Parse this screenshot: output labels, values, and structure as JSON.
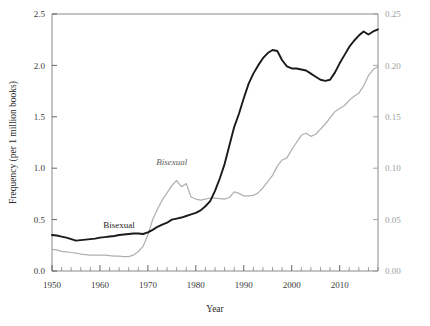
{
  "chart_data": {
    "type": "line",
    "title": "",
    "xlabel": "Year",
    "ylabel": "Frequency (per 1 million books)",
    "ylabel_right": "",
    "xlim": [
      1950,
      2018
    ],
    "ylim": [
      0.0,
      2.5
    ],
    "ylim_right": [
      0.0,
      0.25
    ],
    "grid": false,
    "legend_position": "inline-annotations",
    "xticks": [
      1950,
      1960,
      1970,
      1980,
      1990,
      2000,
      2010
    ],
    "xticklabels": [
      "1950",
      "1960",
      "1970",
      "1980",
      "1990",
      "2000",
      "2010"
    ],
    "xminor_tick_interval": 2,
    "yticks": [
      0.0,
      0.5,
      1.0,
      1.5,
      2.0,
      2.5
    ],
    "yticklabels": [
      "0.0",
      "0.5",
      "1.0",
      "1.5",
      "2.0",
      "2.5"
    ],
    "yticks_right": [
      0.0,
      0.05,
      0.1,
      0.15,
      0.2,
      0.25
    ],
    "yticklabels_right": [
      "0.00",
      "0.05",
      "0.10",
      "0.15",
      "0.20",
      "0.25"
    ],
    "colors": {
      "primary": "#1a1a1a",
      "secondary": "#b0b0b0",
      "axis": "#8a8a8a",
      "right_axis_text": "#9e9e9e"
    },
    "annotations": [
      {
        "text": "Bisexual",
        "series": "primary",
        "x": 1964,
        "y": 0.42,
        "style": "roman"
      },
      {
        "text": "Bisexual",
        "series": "secondary",
        "x": 1975,
        "y": 0.103,
        "style": "italic"
      }
    ],
    "series": [
      {
        "name": "Bisexual",
        "label_style": "roman",
        "axis": "left",
        "color": "#1a1a1a",
        "x": [
          1950,
          1951,
          1952,
          1953,
          1954,
          1955,
          1956,
          1957,
          1958,
          1959,
          1960,
          1961,
          1962,
          1963,
          1964,
          1965,
          1966,
          1967,
          1968,
          1969,
          1970,
          1971,
          1972,
          1973,
          1974,
          1975,
          1976,
          1977,
          1978,
          1979,
          1980,
          1981,
          1982,
          1983,
          1984,
          1985,
          1986,
          1987,
          1988,
          1989,
          1990,
          1991,
          1992,
          1993,
          1994,
          1995,
          1996,
          1997,
          1998,
          1999,
          2000,
          2001,
          2002,
          2003,
          2004,
          2005,
          2006,
          2007,
          2008,
          2009,
          2010,
          2011,
          2012,
          2013,
          2014,
          2015,
          2016,
          2017,
          2018
        ],
        "values": [
          0.35,
          0.345,
          0.335,
          0.325,
          0.31,
          0.295,
          0.3,
          0.305,
          0.31,
          0.315,
          0.325,
          0.33,
          0.335,
          0.34,
          0.35,
          0.355,
          0.36,
          0.365,
          0.365,
          0.36,
          0.375,
          0.4,
          0.43,
          0.45,
          0.47,
          0.5,
          0.51,
          0.52,
          0.535,
          0.55,
          0.565,
          0.59,
          0.63,
          0.68,
          0.78,
          0.9,
          1.04,
          1.22,
          1.4,
          1.53,
          1.68,
          1.82,
          1.92,
          2.0,
          2.07,
          2.12,
          2.15,
          2.14,
          2.05,
          1.99,
          1.97,
          1.97,
          1.96,
          1.95,
          1.92,
          1.89,
          1.86,
          1.85,
          1.86,
          1.93,
          2.02,
          2.1,
          2.18,
          2.24,
          2.29,
          2.33,
          2.3,
          2.33,
          2.35
        ]
      },
      {
        "name": "Bisexual",
        "label_style": "italic",
        "axis": "right",
        "color": "#b0b0b0",
        "x": [
          1950,
          1951,
          1952,
          1953,
          1954,
          1955,
          1956,
          1957,
          1958,
          1959,
          1960,
          1961,
          1962,
          1963,
          1964,
          1965,
          1966,
          1967,
          1968,
          1969,
          1970,
          1971,
          1972,
          1973,
          1974,
          1975,
          1976,
          1977,
          1978,
          1979,
          1980,
          1981,
          1982,
          1983,
          1984,
          1985,
          1986,
          1987,
          1988,
          1989,
          1990,
          1991,
          1992,
          1993,
          1994,
          1995,
          1996,
          1997,
          1998,
          1999,
          2000,
          2001,
          2002,
          2003,
          2004,
          2005,
          2006,
          2007,
          2008,
          2009,
          2010,
          2011,
          2012,
          2013,
          2014,
          2015,
          2016,
          2017,
          2018
        ],
        "values": [
          0.021,
          0.0205,
          0.019,
          0.0185,
          0.018,
          0.0175,
          0.0165,
          0.016,
          0.0155,
          0.0155,
          0.0155,
          0.0155,
          0.015,
          0.0145,
          0.0145,
          0.014,
          0.014,
          0.0155,
          0.019,
          0.024,
          0.035,
          0.05,
          0.06,
          0.069,
          0.076,
          0.083,
          0.088,
          0.082,
          0.085,
          0.072,
          0.07,
          0.069,
          0.07,
          0.071,
          0.071,
          0.0705,
          0.07,
          0.0715,
          0.077,
          0.0755,
          0.073,
          0.073,
          0.0735,
          0.076,
          0.081,
          0.087,
          0.093,
          0.102,
          0.108,
          0.11,
          0.118,
          0.125,
          0.132,
          0.134,
          0.131,
          0.133,
          0.138,
          0.143,
          0.149,
          0.155,
          0.158,
          0.161,
          0.166,
          0.17,
          0.173,
          0.18,
          0.19,
          0.196,
          0.199
        ]
      }
    ]
  }
}
